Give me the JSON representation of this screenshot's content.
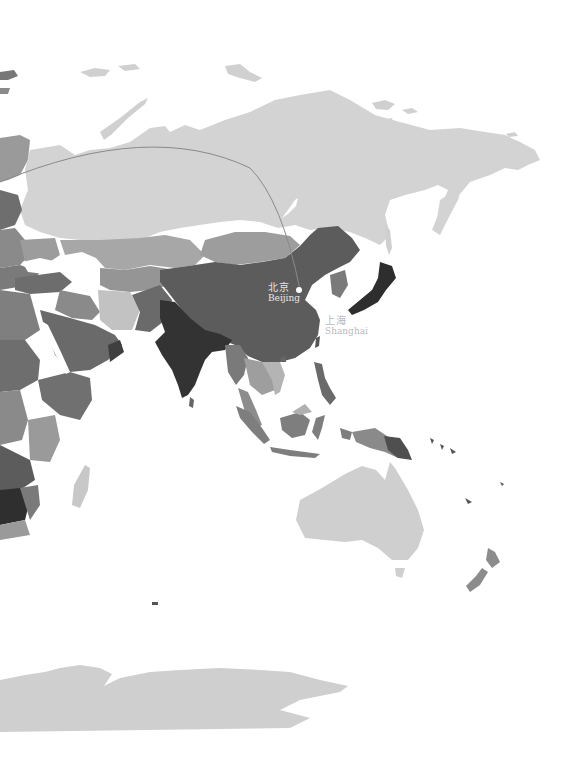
{
  "map": {
    "type": "choropleth",
    "style": "grayscale",
    "region": "Asia, Oceania, East Africa, Antarctica",
    "route": {
      "description": "great-circle arc from Europe to Beijing",
      "stroke_color": "#8a8a8a",
      "end_city": "Beijing"
    },
    "cities": [
      {
        "name_zh": "北京",
        "name_en": "Beijing",
        "marker": "dot",
        "x": 299,
        "y": 290
      },
      {
        "name_zh": "上海",
        "name_en": "Shanghai",
        "marker": "none",
        "x": 324,
        "y": 318
      }
    ],
    "shading": {
      "lightest": "#d3d3d3",
      "light": "#b8b8b8",
      "mid": "#8c8c8c",
      "dark": "#5f5f5f",
      "darkest": "#3a3a3a",
      "ocean": "#ffffff"
    }
  }
}
